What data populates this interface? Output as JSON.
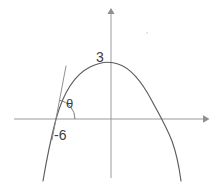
{
  "figure": {
    "name": "downward-parabola-with-tangent-angle",
    "background_color": "#ffffff",
    "labels": {
      "y_intercept": "3",
      "x_intercept": "-6",
      "angle": "θ"
    },
    "colors": {
      "axis": "#9a9a9a",
      "curve": "#5c5c5c",
      "tangent": "#8a8a8a",
      "arc": "#6f6f6f",
      "text": "#3d3d3d"
    },
    "axes": {
      "x_axis": {
        "y": 119,
        "x_start": 14,
        "x_end": 207,
        "arrow": "right"
      },
      "y_axis": {
        "x": 111,
        "y_start": 10,
        "y_end": 178,
        "arrow": "up"
      }
    },
    "curve": {
      "type": "parabola",
      "opens": "down",
      "vertex": {
        "x": 118,
        "y": 64
      },
      "left_x_intercept": {
        "x": 56,
        "y": 119
      },
      "right_x_intercept": {
        "x": 172,
        "y": 119
      },
      "y_intercept_value": "3",
      "left_root_value": "-6"
    },
    "tangent": {
      "at_point": {
        "x": 56,
        "y": 119
      },
      "tip": {
        "x": 66,
        "y": 66
      }
    },
    "angle_arc": {
      "center": {
        "x": 56,
        "y": 119
      },
      "radius": 19
    }
  }
}
